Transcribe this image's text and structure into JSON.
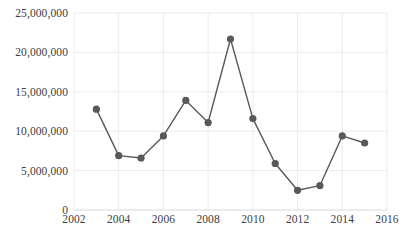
{
  "chart_data": {
    "type": "line",
    "title": "",
    "subtitle": "",
    "xlabel": "",
    "ylabel": "",
    "x": [
      2003,
      2004,
      2005,
      2006,
      2007,
      2008,
      2009,
      2010,
      2011,
      2012,
      2013,
      2014,
      2015
    ],
    "values": [
      12800000,
      6900000,
      6600000,
      9400000,
      13900000,
      11100000,
      21700000,
      11600000,
      5900000,
      2500000,
      3100000,
      9400000,
      8500000
    ],
    "series": [
      {
        "name": "",
        "values": [
          12800000,
          6900000,
          6600000,
          9400000,
          13900000,
          11100000,
          21700000,
          11600000,
          5900000,
          2500000,
          3100000,
          9400000,
          8500000
        ]
      }
    ],
    "xlim": [
      2002,
      2016
    ],
    "ylim": [
      0,
      25000000
    ],
    "y_ticks": [
      0,
      5000000,
      10000000,
      15000000,
      20000000,
      25000000
    ],
    "y_tick_labels": [
      "0",
      "5,000,000",
      "10,000,000",
      "15,000,000",
      "20,000,000",
      "25,000,000"
    ],
    "x_ticks": [
      2002,
      2004,
      2006,
      2008,
      2010,
      2012,
      2014,
      2016
    ],
    "x_tick_labels": [
      "2002",
      "2004",
      "2006",
      "2008",
      "2010",
      "2012",
      "2014",
      "2016"
    ],
    "grid": {
      "horizontal": true,
      "vertical": true,
      "color": "#ececec"
    },
    "legend": {
      "visible": false,
      "position": "none",
      "entries": []
    },
    "style": {
      "line_color": "#595959",
      "marker_color": "#595959",
      "marker_shape": "circle",
      "marker_size": 6,
      "line_width": 1.4,
      "plot_background": "#ffffff",
      "axis_text_color": "#404040"
    }
  }
}
